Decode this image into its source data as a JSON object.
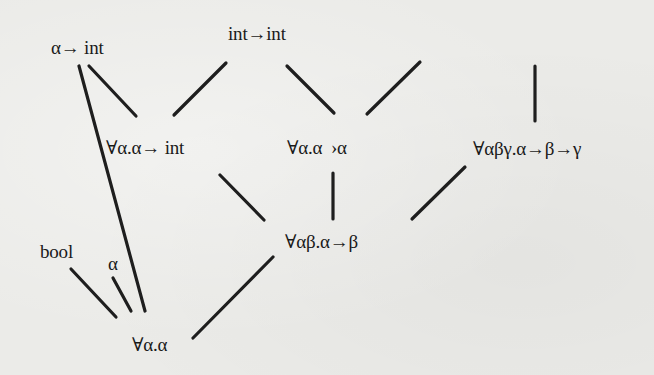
{
  "diagram": {
    "type": "type-lattice",
    "nodes": [
      {
        "id": "n_alpha_to_int",
        "label": "α→ int"
      },
      {
        "id": "n_int_to_int",
        "label": "int→int"
      },
      {
        "id": "n_forall_a_a_to_int",
        "label": "∀α.α→ int"
      },
      {
        "id": "n_forall_a_a_to_a",
        "label": "∀α.α ›α"
      },
      {
        "id": "n_forall_abg",
        "label": "∀αβγ.α→β→γ"
      },
      {
        "id": "n_forall_ab",
        "label": "∀αβ.α→β"
      },
      {
        "id": "n_bool",
        "label": "bool"
      },
      {
        "id": "n_alpha",
        "label": "α"
      },
      {
        "id": "n_forall_a_a",
        "label": "∀α.α"
      }
    ],
    "edges": [
      {
        "from": "n_alpha_to_int",
        "to": "n_forall_a_a"
      },
      {
        "from": "n_alpha_to_int",
        "to": "n_forall_a_a_to_int"
      },
      {
        "from": "n_int_to_int",
        "to": "n_forall_a_a_to_int"
      },
      {
        "from": "n_int_to_int",
        "to": "n_forall_a_a_to_a"
      },
      {
        "from": "(off-screen above)",
        "to": "n_forall_a_a_to_a"
      },
      {
        "from": "(off-screen above)",
        "to": "n_forall_abg"
      },
      {
        "from": "n_forall_a_a_to_int",
        "to": "n_forall_ab"
      },
      {
        "from": "n_forall_a_a_to_a",
        "to": "n_forall_ab"
      },
      {
        "from": "n_forall_abg",
        "to": "n_forall_ab"
      },
      {
        "from": "n_forall_ab",
        "to": "n_forall_a_a"
      },
      {
        "from": "n_bool",
        "to": "n_forall_a_a"
      },
      {
        "from": "n_alpha",
        "to": "n_forall_a_a"
      }
    ]
  }
}
